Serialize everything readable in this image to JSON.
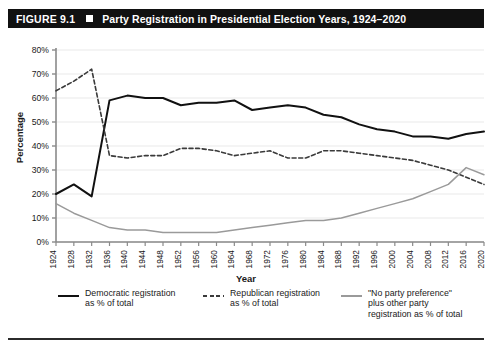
{
  "figure": {
    "number": "FIGURE 9.1",
    "title": "Party Registration in Presidential Election Years, 1924–2020"
  },
  "chart_data": {
    "type": "line",
    "title": "Party Registration in Presidential Election Years, 1924–2020",
    "xlabel": "Year",
    "ylabel": "Percentage",
    "xlim": [
      1924,
      2020
    ],
    "ylim": [
      0,
      80
    ],
    "ytick_labels": [
      "0%",
      "10%",
      "20%",
      "30%",
      "40%",
      "50%",
      "60%",
      "70%",
      "80%"
    ],
    "ytick_values": [
      0,
      10,
      20,
      30,
      40,
      50,
      60,
      70,
      80
    ],
    "grid": true,
    "legend_position": "bottom",
    "categories": [
      1924,
      1928,
      1932,
      1936,
      1940,
      1944,
      1948,
      1952,
      1956,
      1960,
      1964,
      1968,
      1972,
      1976,
      1980,
      1984,
      1988,
      1992,
      1996,
      2000,
      2004,
      2008,
      2012,
      2016,
      2020
    ],
    "xtick_labels": [
      "1924",
      "1928",
      "1932",
      "1936",
      "1940",
      "1944",
      "1948",
      "1952",
      "1956",
      "1960",
      "1964",
      "1968",
      "1972",
      "1976",
      "1980",
      "1984",
      "1988",
      "1992",
      "1996",
      "2000",
      "2004",
      "2008",
      "2012",
      "2016",
      "2020"
    ],
    "series": [
      {
        "name": "Democratic registration as % of total",
        "style": "solid",
        "color": "#111111",
        "values": [
          20,
          24,
          19,
          59,
          61,
          60,
          60,
          57,
          58,
          58,
          59,
          55,
          56,
          57,
          56,
          53,
          52,
          49,
          47,
          46,
          44,
          44,
          43,
          45,
          46
        ]
      },
      {
        "name": "Republican registration as % of total",
        "style": "dashed",
        "color": "#3a3a3a",
        "values": [
          63,
          67,
          72,
          36,
          35,
          36,
          36,
          39,
          39,
          38,
          36,
          37,
          38,
          35,
          35,
          38,
          38,
          37,
          36,
          35,
          34,
          32,
          30,
          27,
          24
        ]
      },
      {
        "name": "\"No party preference\" plus other party registration as % of total",
        "style": "solid",
        "color": "#9a9a9a",
        "values": [
          16,
          12,
          9,
          6,
          5,
          5,
          4,
          4,
          4,
          4,
          5,
          6,
          7,
          8,
          9,
          9,
          10,
          12,
          14,
          16,
          18,
          21,
          24,
          31,
          28
        ]
      }
    ]
  },
  "legend": [
    {
      "id": "dem",
      "swatch": "solid-line-black",
      "text": "Democratic registration\nas % of total"
    },
    {
      "id": "rep",
      "swatch": "dashed-line-black",
      "text": "Republican registration\nas % of total"
    },
    {
      "id": "oth",
      "swatch": "solid-line-gray",
      "text": "\"No party preference\"\nplus other party\nregistration as % of total"
    }
  ]
}
